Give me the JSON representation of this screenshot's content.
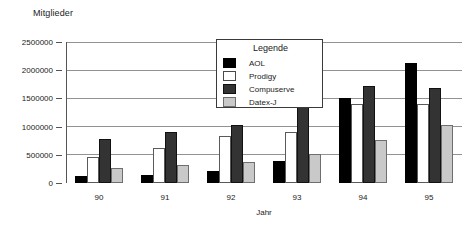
{
  "chart_data": {
    "type": "bar",
    "title": "Mitglieder",
    "xlabel": "Jahr",
    "ylabel": "Mitglieder",
    "categories": [
      "90",
      "91",
      "92",
      "93",
      "94",
      "95"
    ],
    "series": [
      {
        "name": "AOL",
        "color": "#000000",
        "values": [
          120000,
          150000,
          210000,
          390000,
          1500000,
          2120000
        ]
      },
      {
        "name": "Prodigy",
        "color": "#ffffff",
        "values": [
          460000,
          620000,
          830000,
          900000,
          1400000,
          1400000
        ]
      },
      {
        "name": "Compuserve",
        "color": "#333333",
        "values": [
          780000,
          900000,
          1030000,
          1440000,
          1720000,
          1680000
        ]
      },
      {
        "name": "Datex-J",
        "color": "#c9c9c9",
        "values": [
          270000,
          320000,
          380000,
          510000,
          770000,
          1030000
        ]
      }
    ],
    "ylim": [
      0,
      2500000
    ],
    "ytick_labels": [
      "0",
      "500000",
      "1000000",
      "1500000",
      "2000000",
      "2500000"
    ],
    "ytick_values": [
      0,
      500000,
      1000000,
      1500000,
      2000000,
      2500000
    ],
    "grid": true,
    "legend_position": "inside-top-right",
    "legend_title": "Legende"
  }
}
